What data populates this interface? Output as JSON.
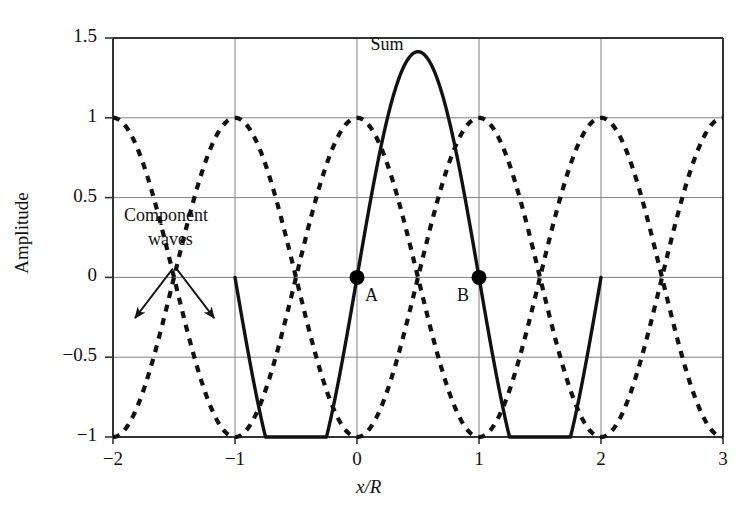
{
  "chart_data": {
    "type": "line",
    "title": "",
    "xlabel": "x/R",
    "ylabel": "Amplitude",
    "xlim": [
      -2,
      3
    ],
    "ylim": [
      -1,
      1.5
    ],
    "xticks": [
      "−2",
      "−1",
      "0",
      "1",
      "2",
      "3"
    ],
    "xtick_values": [
      -2,
      -1,
      0,
      1,
      2,
      3
    ],
    "yticks": [
      "1.5",
      "1",
      "0.5",
      "0",
      "−0.5",
      "−1"
    ],
    "ytick_values": [
      1.5,
      1,
      0.5,
      0,
      -0.5,
      -1
    ],
    "grid": true,
    "legend_position": "inline-annotations",
    "series": [
      {
        "name": "Component wave 1",
        "style": "dashed",
        "formula": "cos(pi*(x+1))",
        "domain": [
          -2,
          3
        ],
        "note": "minima at x = -2, 0, 2 ; maxima at x = -1, 1, 3"
      },
      {
        "name": "Component wave 2",
        "style": "dashed",
        "formula": "cos(pi*x)",
        "domain": [
          -2,
          3
        ],
        "note": "maxima at x = -2, 0, 2 ; minima at x = -1, 1, 3"
      },
      {
        "name": "Sum",
        "style": "solid",
        "formula": "sqrt(2)*cos(pi*(x-0.5)) shown on -1..2",
        "domain": [
          -1,
          2
        ],
        "peak_x": 0.5,
        "peak_y": 1.414,
        "endpoints_y": [
          -1,
          -1
        ]
      }
    ],
    "annotations": [
      {
        "id": "sum",
        "text": "Sum",
        "x": 0.11,
        "y": 1.45
      },
      {
        "id": "component-waves",
        "text": "Component\nwaves",
        "line1": "Component",
        "line2": "waves",
        "x": -1.55,
        "y": 0.38
      }
    ],
    "markers": [
      {
        "id": "A",
        "label": "A",
        "x": 0,
        "y": 0,
        "label_side": "right"
      },
      {
        "id": "B",
        "label": "B",
        "x": 1,
        "y": 0,
        "label_side": "left"
      }
    ],
    "arrows": [
      {
        "from_x": -1.51,
        "from_y": 0.055,
        "to_x": -1.82,
        "to_y": -0.255
      },
      {
        "from_x": -1.48,
        "from_y": 0.055,
        "to_x": -1.17,
        "to_y": -0.255
      }
    ],
    "colors": {
      "axis": "#333333",
      "grid": "#808080",
      "curve": "#111111",
      "marker": "#000000",
      "background": "#ffffff"
    }
  }
}
